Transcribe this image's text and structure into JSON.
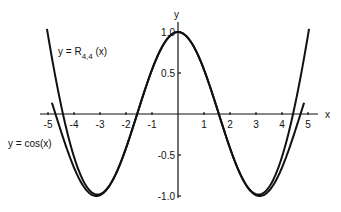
{
  "chart_data": {
    "type": "line",
    "title": "",
    "xlabel": "x",
    "ylabel": "y",
    "xlim": [
      -5.2,
      5.2
    ],
    "ylim": [
      -1.05,
      1.1
    ],
    "grid": false,
    "x_ticks": [
      -5,
      -4,
      -3,
      -2,
      -1,
      1,
      2,
      3,
      4,
      5
    ],
    "x_tick_labels": [
      "-5",
      "-4",
      "-3",
      "-2",
      "-1",
      "1",
      "2",
      "3",
      "4",
      "5"
    ],
    "y_ticks": [
      1.0,
      0.5,
      -0.5,
      -1.0
    ],
    "y_tick_labels": [
      "1.0",
      "0.5",
      "-0.5",
      "-1.0"
    ],
    "series": [
      {
        "name": "y = cos(x)",
        "function": "cos(x)",
        "x": [
          -4.8,
          -4,
          -3,
          -2,
          -1,
          0,
          1,
          2,
          3,
          4,
          4.8
        ],
        "values": [
          0.09,
          -0.65,
          -0.99,
          -0.42,
          0.54,
          1.0,
          0.54,
          -0.42,
          -0.99,
          -0.65,
          0.09
        ]
      },
      {
        "name": "y = R_{4,4}(x)",
        "function": "Padé approximant R_{4,4}(x) of cos(x)",
        "x": [
          -5.2,
          -4.8,
          -4,
          -3,
          -2,
          -1,
          0,
          1,
          2,
          3,
          4,
          4.8,
          5.2
        ],
        "values": [
          1.0,
          0.28,
          -0.6,
          -1.0,
          -0.42,
          0.54,
          1.0,
          0.54,
          -0.42,
          -1.0,
          -0.6,
          0.28,
          1.0
        ]
      }
    ],
    "annotations": [
      {
        "text": "y = R",
        "subscript": "4,4",
        "suffix": " (x)",
        "series": "R_{4,4}"
      },
      {
        "text": "y = cos(x)",
        "series": "cos"
      }
    ]
  },
  "labels": {
    "x_axis": "x",
    "y_axis": "y",
    "r_label_main": "y = R",
    "r_label_sub": "4,4",
    "r_label_tail": " (x)",
    "cos_label": "y = cos(x)"
  }
}
